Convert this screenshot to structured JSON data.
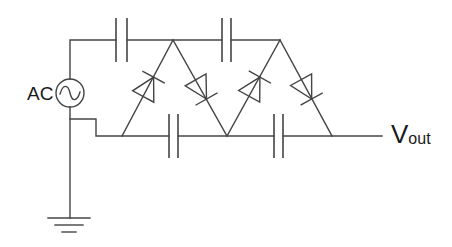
{
  "diagram": {
    "type": "circuit",
    "source": {
      "label": "AC",
      "symbol": "sine-wave-in-circle"
    },
    "output": {
      "label_main": "V",
      "label_sub": "out"
    },
    "components": {
      "capacitors": 4,
      "diodes": 4,
      "ground": 1
    },
    "colors": {
      "line": "#444444",
      "text": "#1a1a1a",
      "background": "#ffffff"
    }
  }
}
